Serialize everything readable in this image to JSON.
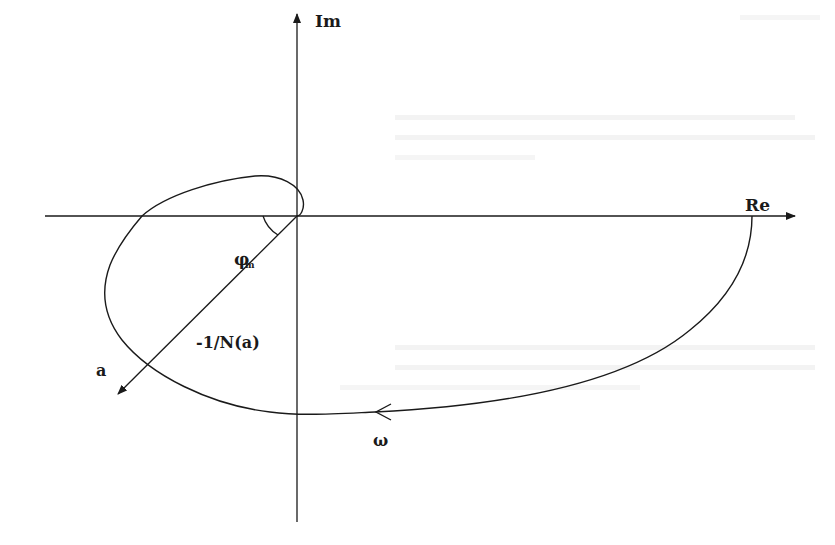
{
  "diagram": {
    "axes": {
      "real_label": "Re",
      "imag_label": "Im"
    },
    "labels": {
      "describing_function": "-1/N(a)",
      "amplitude": "a",
      "frequency": "ω",
      "phase_margin_symbol": "φ",
      "phase_margin_subscript": "m"
    },
    "colors": {
      "stroke": "#1a1a1a",
      "background": "#ffffff",
      "bleed_through_text": "#ececec"
    }
  }
}
